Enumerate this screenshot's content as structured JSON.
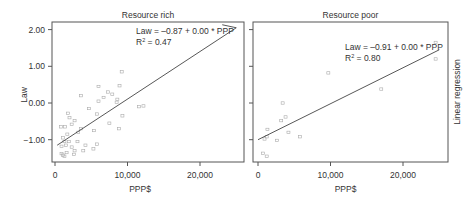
{
  "chart_data": [
    {
      "type": "scatter",
      "title": "Resource rich",
      "xlabel": "PPP$",
      "ylabel": "Law",
      "xlim": [
        0,
        25000
      ],
      "ylim": [
        -1.6,
        2.2
      ],
      "xticks": [
        "0",
        "10,000",
        "20,000"
      ],
      "xtick_values": [
        0,
        10000,
        20000
      ],
      "yticks": [
        "2.00",
        "1.00",
        "0.00",
        "-1.00"
      ],
      "ytick_values": [
        2,
        1,
        0,
        -1
      ],
      "grid": false,
      "regression": {
        "intercept": -0.87,
        "slope_display": "0.00",
        "r2": 0.47,
        "x0": 300,
        "y0": -1.15,
        "x1": 25000,
        "y1": 2.05
      },
      "annotation": {
        "equation": "Law = –0.87 + 0.00 * PPP",
        "r2_label": "R",
        "r2_sup": "2",
        "r2_value": " = 0.47"
      },
      "points": [
        [
          9200,
          0.85
        ],
        [
          6000,
          0.45
        ],
        [
          8900,
          0.47
        ],
        [
          7300,
          0.3
        ],
        [
          7900,
          0.24
        ],
        [
          6700,
          0.15
        ],
        [
          3600,
          0.2
        ],
        [
          6000,
          0.05
        ],
        [
          8600,
          0.1
        ],
        [
          8500,
          0.02
        ],
        [
          4700,
          -0.15
        ],
        [
          5800,
          -0.3
        ],
        [
          11600,
          -0.1
        ],
        [
          12200,
          -0.08
        ],
        [
          9300,
          -0.35
        ],
        [
          7500,
          -0.55
        ],
        [
          8800,
          -0.7
        ],
        [
          1800,
          -0.28
        ],
        [
          2000,
          -0.4
        ],
        [
          2700,
          -0.48
        ],
        [
          2300,
          -0.58
        ],
        [
          3600,
          -0.7
        ],
        [
          3200,
          -0.8
        ],
        [
          5400,
          -0.75
        ],
        [
          1400,
          -0.65
        ],
        [
          1700,
          -0.85
        ],
        [
          1100,
          -0.95
        ],
        [
          1300,
          -1.05
        ],
        [
          1900,
          -1.05
        ],
        [
          3100,
          -1.05
        ],
        [
          4200,
          -1.15
        ],
        [
          5800,
          -1.12
        ],
        [
          1500,
          -1.15
        ],
        [
          2300,
          -1.2
        ],
        [
          900,
          -1.18
        ],
        [
          2700,
          -1.3
        ],
        [
          3900,
          -1.3
        ],
        [
          5300,
          -1.25
        ],
        [
          1600,
          -1.35
        ],
        [
          900,
          -1.38
        ],
        [
          1100,
          -1.42
        ],
        [
          1300,
          -1.45
        ],
        [
          2600,
          -1.4
        ],
        [
          800,
          -0.65
        ]
      ]
    },
    {
      "type": "scatter",
      "title": "Resource poor",
      "xlabel": "PPP$",
      "ylabel": "",
      "xlim": [
        0,
        25000
      ],
      "ylim": [
        -1.6,
        2.2
      ],
      "xticks": [
        "0",
        "10,000",
        "20,000"
      ],
      "xtick_values": [
        0,
        10000,
        20000
      ],
      "yticks": [],
      "grid": false,
      "regression": {
        "intercept": -0.91,
        "slope_display": "0.00",
        "r2": 0.8,
        "x0": 0,
        "y0": -1.0,
        "x1": 25000,
        "y1": 1.45
      },
      "annotation": {
        "equation": "Law = –0.91 + 0.00 * PPP",
        "r2_label": "R",
        "r2_sup": "2",
        "r2_value": " = 0.80"
      },
      "points": [
        [
          24500,
          1.65
        ],
        [
          24500,
          1.2
        ],
        [
          9700,
          0.82
        ],
        [
          17000,
          0.38
        ],
        [
          3400,
          0.0
        ],
        [
          3800,
          -0.38
        ],
        [
          3200,
          -0.48
        ],
        [
          1300,
          -0.72
        ],
        [
          4200,
          -0.8
        ],
        [
          5800,
          -0.92
        ],
        [
          1200,
          -0.92
        ],
        [
          2600,
          -1.02
        ],
        [
          900,
          -0.98
        ],
        [
          700,
          -1.37
        ],
        [
          1200,
          -1.45
        ]
      ]
    }
  ],
  "side_label": "Linear regression"
}
